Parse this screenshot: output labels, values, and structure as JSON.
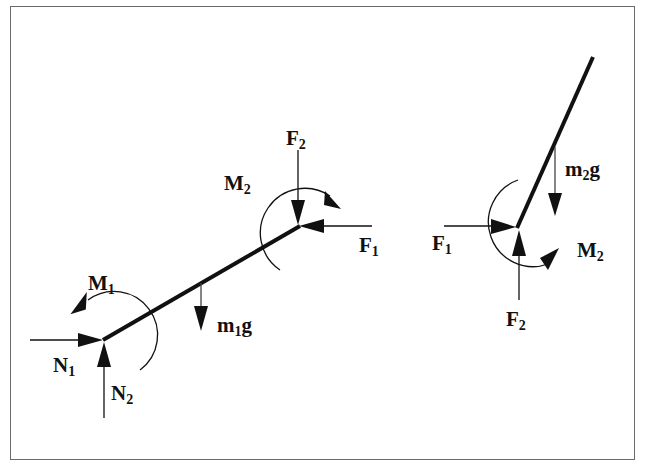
{
  "diagram": {
    "type": "free-body-diagram",
    "left_body": {
      "labels": {
        "M1": {
          "base": "M",
          "sub": "1"
        },
        "N1": {
          "base": "N",
          "sub": "1"
        },
        "N2": {
          "base": "N",
          "sub": "2"
        },
        "m1g": {
          "base": "m",
          "sub": "1",
          "tail": "g"
        },
        "F2": {
          "base": "F",
          "sub": "2"
        },
        "F1": {
          "base": "F",
          "sub": "1"
        },
        "M2": {
          "base": "M",
          "sub": "2"
        }
      }
    },
    "right_body": {
      "labels": {
        "m2g": {
          "base": "m",
          "sub": "2",
          "tail": "g"
        },
        "F1": {
          "base": "F",
          "sub": "1"
        },
        "M2": {
          "base": "M",
          "sub": "2"
        },
        "F2": {
          "base": "F",
          "sub": "2"
        }
      }
    },
    "colors": {
      "ink": "#111111",
      "frame": "#6a6a6a",
      "background": "#ffffff"
    }
  }
}
